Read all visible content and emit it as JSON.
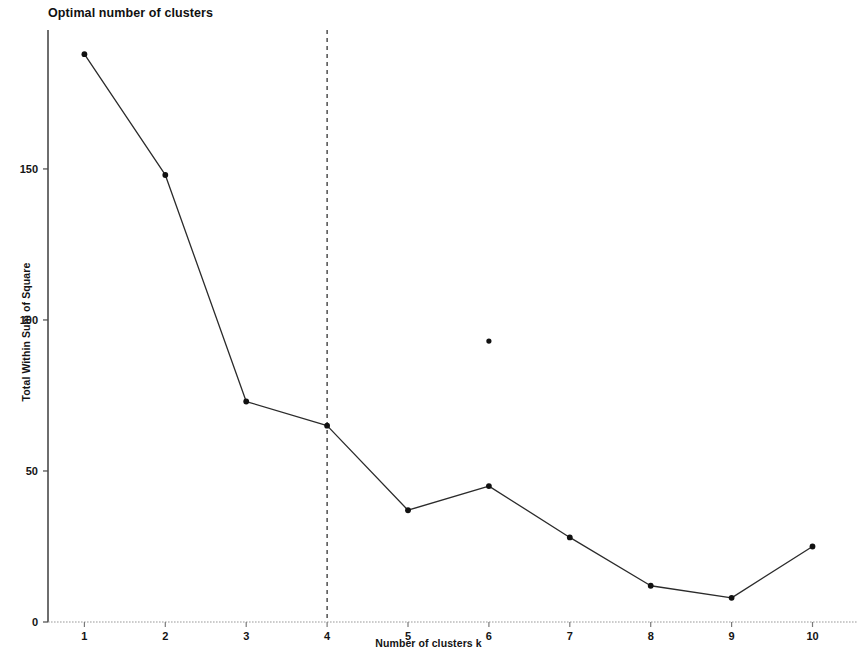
{
  "chart_data": {
    "type": "line",
    "title": "Optimal number of clusters",
    "xlabel": "Number of clusters k",
    "ylabel": "Total Within Sum of Square",
    "x": [
      1,
      2,
      3,
      4,
      5,
      6,
      7,
      8,
      9,
      10
    ],
    "values": [
      188,
      148,
      73,
      65,
      37,
      45,
      28,
      12,
      8,
      25
    ],
    "series": [
      {
        "name": "Total Within Sum of Square",
        "values": [
          188,
          148,
          73,
          65,
          37,
          45,
          28,
          12,
          8,
          25
        ]
      }
    ],
    "xlim": [
      0.55,
      10.55
    ],
    "ylim": [
      0,
      196
    ],
    "x_ticks": [
      1,
      2,
      3,
      4,
      5,
      6,
      7,
      8,
      9,
      10
    ],
    "x_tick_labels": [
      "1",
      "2",
      "3",
      "4",
      "5",
      "6",
      "7",
      "8",
      "9",
      "10"
    ],
    "y_ticks": [
      0,
      50,
      100,
      150
    ],
    "y_tick_labels": [
      "0",
      "50",
      "100",
      "150"
    ],
    "grid": false,
    "legend": "none",
    "line_color": "#2b2b2b",
    "marker_color": "#111111",
    "axis_color": "#555555",
    "annotations": [
      {
        "type": "vertical-dashed-line",
        "name": "optimal-k-line",
        "x": 4,
        "label": "",
        "color": "#222222"
      },
      {
        "type": "stray-point",
        "name": "outlier-marker",
        "x": 6,
        "y": 93,
        "color": "#111111"
      }
    ]
  },
  "figure": {
    "title": "Optimal number of clusters",
    "xlabel": "Number of clusters k",
    "ylabel": "Total Within Sum of Square"
  }
}
